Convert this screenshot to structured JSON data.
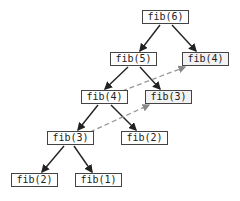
{
  "diagram": {
    "nodes": [
      {
        "id": "n6",
        "label": "fib(6)",
        "x": 142,
        "y": 10,
        "memo": false
      },
      {
        "id": "n5",
        "label": "fib(5)",
        "x": 110,
        "y": 52,
        "memo": false
      },
      {
        "id": "n4r",
        "label": "fib(4)",
        "x": 182,
        "y": 52,
        "memo": true
      },
      {
        "id": "n4l",
        "label": "fib(4)",
        "x": 81,
        "y": 90,
        "memo": false
      },
      {
        "id": "n3r",
        "label": "fib(3)",
        "x": 145,
        "y": 90,
        "memo": true
      },
      {
        "id": "n3l",
        "label": "fib(3)",
        "x": 47,
        "y": 131,
        "memo": false
      },
      {
        "id": "n2m",
        "label": "fib(2)",
        "x": 121,
        "y": 131,
        "memo": false
      },
      {
        "id": "n2b",
        "label": "fib(2)",
        "x": 11,
        "y": 173,
        "memo": false
      },
      {
        "id": "n1",
        "label": "fib(1)",
        "x": 75,
        "y": 173,
        "memo": false
      }
    ],
    "edges": [
      {
        "from": "n6",
        "to": "n5",
        "style": "solid"
      },
      {
        "from": "n6",
        "to": "n4r",
        "style": "solid"
      },
      {
        "from": "n5",
        "to": "n4l",
        "style": "solid"
      },
      {
        "from": "n5",
        "to": "n3r",
        "style": "solid"
      },
      {
        "from": "n4l",
        "to": "n3l",
        "style": "solid"
      },
      {
        "from": "n4l",
        "to": "n2m",
        "style": "solid"
      },
      {
        "from": "n3l",
        "to": "n2b",
        "style": "solid"
      },
      {
        "from": "n3l",
        "to": "n1",
        "style": "solid"
      },
      {
        "from": "n4l",
        "to": "n4r",
        "style": "dashed"
      },
      {
        "from": "n3l",
        "to": "n3r",
        "style": "dashed"
      }
    ]
  }
}
